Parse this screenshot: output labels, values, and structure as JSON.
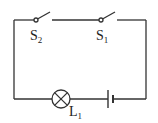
{
  "diagram": {
    "type": "circuit-schematic",
    "components": [
      {
        "id": "S2",
        "kind": "switch",
        "state": "open",
        "label_main": "S",
        "label_sub": "2"
      },
      {
        "id": "S1",
        "kind": "switch",
        "state": "open",
        "label_main": "S",
        "label_sub": "1"
      },
      {
        "id": "L1",
        "kind": "lamp",
        "label_main": "L",
        "label_sub": "1"
      },
      {
        "id": "battery",
        "kind": "cell"
      }
    ],
    "connections": "series loop: S2 - S1 - battery - L1",
    "colors": {
      "wire": "#333333",
      "background": "#ffffff"
    }
  }
}
